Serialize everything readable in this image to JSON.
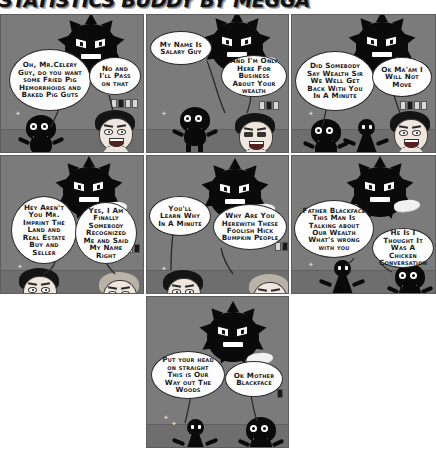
{
  "title": "STATISTICS BUDDY BY MEGGA",
  "colors": {
    "panel_bg": "#7b7b7b",
    "floor": "#6e6e6e",
    "ink": "#0a0a0a",
    "bubble": "#ffffff",
    "gutter": "#ffffff",
    "skin": "#efe6de"
  },
  "panels": [
    {
      "id": "panel-1",
      "bubbles": [
        {
          "id": "bubble-1a",
          "text": "Oh, Mr.Celery Guy, do you want some Fried Pig Hemorrhoids and Baked Pig Guts"
        },
        {
          "id": "bubble-1b",
          "text": "No and I'll Pass on that"
        }
      ],
      "characters": [
        "spiky-creature",
        "blob-character",
        "human-dark-hair"
      ]
    },
    {
      "id": "panel-2",
      "bubbles": [
        {
          "id": "bubble-2a",
          "text": "My Name Is Salary Guy"
        },
        {
          "id": "bubble-2b",
          "text": "And I'm Only Here For Business About Your wealth"
        }
      ],
      "characters": [
        "spiky-creature",
        "blob-character",
        "human-squinting"
      ]
    },
    {
      "id": "panel-3",
      "bubbles": [
        {
          "id": "bubble-3a",
          "text": "Did Somebody Say Wealth Sir We Well Get Back With You In A Minute"
        },
        {
          "id": "bubble-3b",
          "text": "Ok Ma'am I Will Not Move"
        }
      ],
      "characters": [
        "spiky-creature",
        "blob-character",
        "stick-person",
        "human-dark-hair"
      ]
    },
    {
      "id": "panel-4",
      "bubbles": [
        {
          "id": "bubble-4a",
          "text": "Hey Aren't You Mr. Imprint The Land and Real Estate Buy and Seller"
        },
        {
          "id": "bubble-4b",
          "text": "Yes, I Am Finally Somebody Recognized Me and Said My Name Right"
        }
      ],
      "characters": [
        "spiky-creature",
        "human-dark-hair",
        "human-blond"
      ]
    },
    {
      "id": "panel-5",
      "bubbles": [
        {
          "id": "bubble-5a",
          "text": "You'll Learn Why In A Minute"
        },
        {
          "id": "bubble-5b",
          "text": "Why Are You Herewith These Foolish Hick Bumpkin People"
        }
      ],
      "characters": [
        "spiky-creature",
        "human-dark-hair",
        "human-blond"
      ]
    },
    {
      "id": "panel-6",
      "bubbles": [
        {
          "id": "bubble-6a",
          "text": "Father Blackface This Man Is Talking about Our Wealth What's wrong with you"
        },
        {
          "id": "bubble-6b",
          "text": "He Is I Thought It Was A Chicken Conversation"
        }
      ],
      "characters": [
        "spiky-creature",
        "stick-person",
        "blob-character"
      ]
    },
    {
      "id": "panel-7",
      "bubbles": [
        {
          "id": "bubble-7a",
          "text": "Put your head on straight This is Our Way out The Woods"
        },
        {
          "id": "bubble-7b",
          "text": "Ok Mother Blackface"
        }
      ],
      "characters": [
        "spiky-creature",
        "stick-person",
        "blob-character"
      ]
    }
  ]
}
